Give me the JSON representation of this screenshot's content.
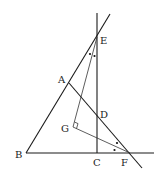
{
  "diagram": {
    "type": "geometry",
    "points": {
      "A": {
        "label": "A",
        "x": 69,
        "y": 83
      },
      "B": {
        "label": "B",
        "x": 26,
        "y": 153
      },
      "C": {
        "label": "C",
        "x": 97,
        "y": 153
      },
      "D": {
        "label": "D",
        "x": 97,
        "y": 116
      },
      "E": {
        "label": "E",
        "x": 97,
        "y": 37
      },
      "F": {
        "label": "F",
        "x": 130,
        "y": 153
      },
      "G": {
        "label": "G",
        "x": 72,
        "y": 127
      }
    },
    "lines": [
      {
        "name": "vertical-line-ec",
        "from": [
          97,
          13
        ],
        "to": [
          97,
          153
        ]
      },
      {
        "name": "line-be-extended",
        "from": [
          26,
          153
        ],
        "to": [
          110,
          15
        ]
      },
      {
        "name": "line-af-extended",
        "from": [
          69,
          83
        ],
        "to": [
          142,
          167
        ]
      },
      {
        "name": "baseline-bf",
        "from": [
          26,
          153
        ],
        "to": [
          154,
          153
        ]
      },
      {
        "name": "segment-eg",
        "from": [
          97,
          37
        ],
        "to": [
          72,
          127
        ]
      },
      {
        "name": "segment-gf",
        "from": [
          72,
          127
        ],
        "to": [
          130,
          153
        ]
      }
    ],
    "annotations": {
      "right_angle_at": "G",
      "equal_angle_marks": [
        "angle-at-E (GEA = GED)",
        "angle-at-F (GFD = GFC)"
      ]
    },
    "label_text": {
      "A": "A",
      "B": "B",
      "C": "C",
      "D": "D",
      "E": "E",
      "F": "F",
      "G": "G"
    },
    "colors": {
      "stroke": "#1a1a1a",
      "background": "#ffffff"
    }
  }
}
